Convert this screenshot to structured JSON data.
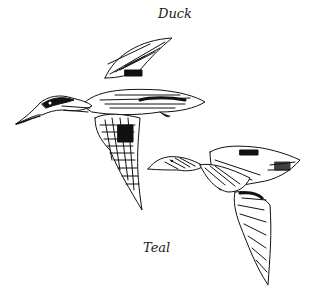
{
  "illustration": {
    "labels": {
      "top": "Duck",
      "bottom": "Teal"
    },
    "subjects": [
      {
        "name": "duck",
        "description": "Larger duck in flight, dark head, facing left, wings raised"
      },
      {
        "name": "teal",
        "description": "Smaller teal in flight, facing left, wings spread down-right"
      }
    ],
    "colors": {
      "ink": "#111111",
      "background": "#ffffff"
    }
  }
}
